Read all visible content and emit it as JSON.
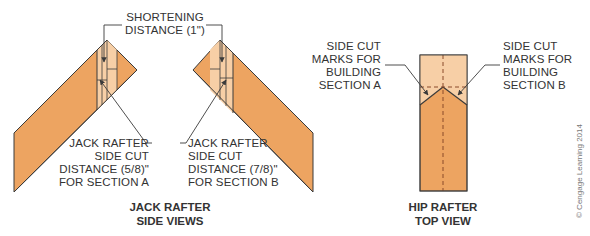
{
  "colors": {
    "wood_dark": "#EDA461",
    "wood_light": "#F7CFA6",
    "wood_mid": "#F0B57C",
    "line": "#3a3a3a",
    "text": "#333333"
  },
  "shortening": {
    "line1": "SHORTENING",
    "line2": "DISTANCE (1\")"
  },
  "jack_a_label": {
    "line1": "JACK RAFTER",
    "line2": "SIDE CUT",
    "line3": "DISTANCE (5/8)\"",
    "line4": "FOR SECTION A"
  },
  "jack_b_label": {
    "line1": "JACK RAFTER",
    "line2": "SIDE CUT",
    "line3": "DISTANCE (7/8)\"",
    "line4": "FOR SECTION B"
  },
  "side_cut_a": {
    "line1": "SIDE CUT",
    "line2": "MARKS FOR",
    "line3": "BUILDING",
    "line4": "SECTION A"
  },
  "side_cut_b": {
    "line1": "SIDE CUT",
    "line2": "MARKS FOR",
    "line3": "BUILDING",
    "line4": "SECTION B"
  },
  "titles": {
    "side_views_line1": "JACK RAFTER",
    "side_views_line2": "SIDE VIEWS",
    "top_view_line1": "HIP RAFTER",
    "top_view_line2": "TOP VIEW"
  },
  "credit": "© Cengage Learning 2014"
}
